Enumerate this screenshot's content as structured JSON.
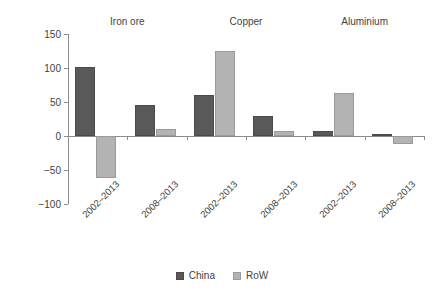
{
  "chart_data": {
    "type": "bar",
    "title": "",
    "xlabel": "",
    "ylabel": "Percentage change",
    "ylim": [
      -100,
      150
    ],
    "yticks": [
      150,
      100,
      50,
      0,
      -50,
      -100
    ],
    "ytick_labels": [
      "150",
      "100",
      "50",
      "0",
      "−50",
      "−100"
    ],
    "grid": false,
    "legend_position": "bottom-center",
    "group_labels": [
      "Iron ore",
      "Copper",
      "Aluminium"
    ],
    "categories": [
      "2002–2013",
      "2008–2013",
      "2002–2013",
      "2008–2013",
      "2002–2013",
      "2008–2013"
    ],
    "series": [
      {
        "name": "China",
        "color": "#595959",
        "values": [
          101,
          46,
          61,
          30,
          8,
          3
        ]
      },
      {
        "name": "RoW",
        "color": "#b3b3b3",
        "values": [
          -62,
          11,
          125,
          8,
          63,
          -12
        ]
      }
    ]
  },
  "legend": {
    "items": [
      {
        "label": "China",
        "color": "#595959"
      },
      {
        "label": "RoW",
        "color": "#b3b3b3"
      }
    ]
  }
}
